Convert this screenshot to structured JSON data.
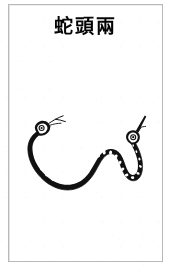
{
  "page": {
    "background_color": "#ffffff",
    "frame_color": "#b9b9b9",
    "ink_color": "#111111"
  },
  "title": {
    "text": "蛇頭兩",
    "reading_order": "right-to-left",
    "romanized": "liang tou she",
    "meaning": "Two-Headed Snake"
  },
  "illustration": {
    "caption_name": "two-headed-snake-drawing",
    "subject": "two-headed snake",
    "style": "woodblock ink line drawing",
    "head_count": "2",
    "features": {
      "left_head_label": "left head with eye and forked tongue",
      "right_head_label": "right head with eye and pointed tongue",
      "body_label": "S-curved body with banded scale markings"
    }
  }
}
